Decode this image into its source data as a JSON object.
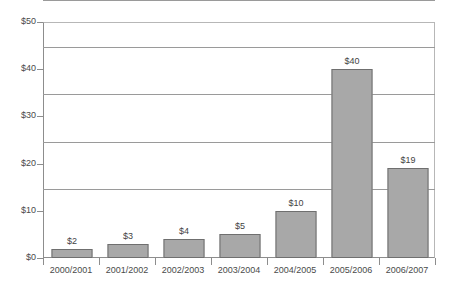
{
  "chart_data": {
    "type": "bar",
    "title": "",
    "subtitle": "",
    "xlabel": "",
    "ylabel": "",
    "categories": [
      "2000/2001",
      "2001/2002",
      "2002/2003",
      "2003/2004",
      "2004/2005",
      "2005/2006",
      "2006/2007"
    ],
    "values": [
      2,
      3,
      4,
      5,
      10,
      40,
      19
    ],
    "data_labels": [
      "$2",
      "$3",
      "$4",
      "$5",
      "$10",
      "$40",
      "$19"
    ],
    "ylim": [
      0,
      50
    ],
    "ytick_values": [
      0,
      10,
      20,
      30,
      40,
      50
    ],
    "ytick_labels": [
      "$0",
      "$10",
      "$20",
      "$30",
      "$40",
      "$50"
    ],
    "grid": "horizontal",
    "legend": "none",
    "series": [
      {
        "name": "",
        "values": [
          2,
          3,
          4,
          5,
          10,
          40,
          19
        ]
      }
    ],
    "colors": {
      "bar_fill": "#a8a8a8",
      "bar_border": "#6f6f6f",
      "gridline": "#9a9a9a",
      "axis": "#8d8d8d",
      "text": "#4a4a4a",
      "background": "#ffffff"
    }
  }
}
